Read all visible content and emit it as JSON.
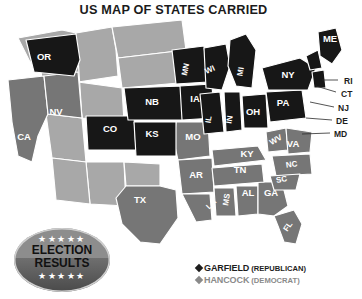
{
  "title": "US MAP OF STATES CARRIED",
  "badge": {
    "line1": "ELECTION",
    "line2": "RESULTS",
    "stars_top": "★★★★★",
    "stars_bottom": "★★★★★"
  },
  "legend": {
    "items": [
      {
        "marker": "diamond",
        "name": "GARFIELD",
        "party": "(REPUBLICAN)",
        "color": "#1d1d1d"
      },
      {
        "marker": "diamond",
        "name": "HANCOCK",
        "party": "(DEMOCRAT)",
        "color": "#8a8a8a"
      }
    ]
  },
  "map": {
    "colors": {
      "republican": "#171717",
      "democrat": "#767676",
      "territory": "#a8a8a8",
      "border": "#ffffff"
    },
    "inline_labels": [
      {
        "code": "OR",
        "x": 44,
        "y": 50,
        "party": "republican"
      },
      {
        "code": "NV",
        "x": 56,
        "y": 105,
        "party": "democrat"
      },
      {
        "code": "CA",
        "x": 24,
        "y": 130,
        "party": "democrat"
      },
      {
        "code": "CO",
        "x": 110,
        "y": 122,
        "party": "republican"
      },
      {
        "code": "NB",
        "x": 152,
        "y": 95,
        "party": "republican"
      },
      {
        "code": "KS",
        "x": 152,
        "y": 127,
        "party": "republican"
      },
      {
        "code": "TX",
        "x": 140,
        "y": 193,
        "party": "democrat"
      },
      {
        "code": "IA",
        "x": 195,
        "y": 92,
        "party": "republican"
      },
      {
        "code": "MN",
        "x": 188,
        "y": 60,
        "party": "republican"
      },
      {
        "code": "WI",
        "x": 211,
        "y": 62,
        "party": "republican"
      },
      {
        "code": "MI",
        "x": 243,
        "y": 62,
        "party": "republican"
      },
      {
        "code": "IL",
        "x": 211,
        "y": 110,
        "party": "republican"
      },
      {
        "code": "IN",
        "x": 232,
        "y": 110,
        "party": "republican"
      },
      {
        "code": "OH",
        "x": 253,
        "y": 105,
        "party": "republican"
      },
      {
        "code": "PA",
        "x": 283,
        "y": 96,
        "party": "republican"
      },
      {
        "code": "NY",
        "x": 288,
        "y": 68,
        "party": "republican"
      },
      {
        "code": "ME",
        "x": 330,
        "y": 32,
        "party": "republican"
      },
      {
        "code": "MO",
        "x": 193,
        "y": 130,
        "party": "democrat"
      },
      {
        "code": "AR",
        "x": 196,
        "y": 168,
        "party": "democrat"
      },
      {
        "code": "LA",
        "x": 213,
        "y": 196,
        "party": "democrat"
      },
      {
        "code": "MS",
        "x": 229,
        "y": 190,
        "party": "democrat"
      },
      {
        "code": "AL",
        "x": 248,
        "y": 186,
        "party": "democrat"
      },
      {
        "code": "GA",
        "x": 271,
        "y": 186,
        "party": "democrat"
      },
      {
        "code": "FL",
        "x": 290,
        "y": 218,
        "party": "democrat"
      },
      {
        "code": "TN",
        "x": 240,
        "y": 163,
        "party": "democrat"
      },
      {
        "code": "KY",
        "x": 247,
        "y": 147,
        "party": "democrat"
      },
      {
        "code": "WV",
        "x": 277,
        "y": 132,
        "party": "democrat"
      },
      {
        "code": "VA",
        "x": 293,
        "y": 137,
        "party": "democrat"
      },
      {
        "code": "NC",
        "x": 292,
        "y": 157,
        "party": "democrat"
      },
      {
        "code": "SC",
        "x": 282,
        "y": 172,
        "party": "democrat"
      }
    ],
    "outside_labels": [
      {
        "code": "RI",
        "x": 344,
        "y": 74
      },
      {
        "code": "CT",
        "x": 341,
        "y": 87
      },
      {
        "code": "NJ",
        "x": 338,
        "y": 101
      },
      {
        "code": "DE",
        "x": 336,
        "y": 114
      },
      {
        "code": "MD",
        "x": 334,
        "y": 127
      }
    ]
  }
}
